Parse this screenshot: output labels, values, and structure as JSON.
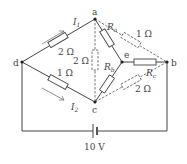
{
  "diagram": {
    "type": "circuit",
    "nodes": {
      "a": {
        "label": "a",
        "x": 95,
        "y": 19
      },
      "b": {
        "label": "b",
        "x": 167,
        "y": 62
      },
      "c": {
        "label": "c",
        "x": 95,
        "y": 102
      },
      "d": {
        "label": "d",
        "x": 22,
        "y": 62
      },
      "e": {
        "label": "e",
        "x": 122,
        "y": 62
      }
    },
    "currents": {
      "i1": {
        "main": "I",
        "sub": "1"
      },
      "i2": {
        "main": "I",
        "sub": "2"
      }
    },
    "resistors": {
      "da": "2 Ω",
      "dc": "1 Ω",
      "ac_dashed": "2 Ω",
      "ab_dashed": "1 Ω",
      "cb_dashed": "2 Ω",
      "Ra": {
        "main": "R",
        "sub": "a"
      },
      "Rb": {
        "main": "R",
        "sub": "b"
      },
      "Rc": {
        "main": "R",
        "sub": "c"
      }
    },
    "battery": {
      "label": "10 V"
    }
  }
}
